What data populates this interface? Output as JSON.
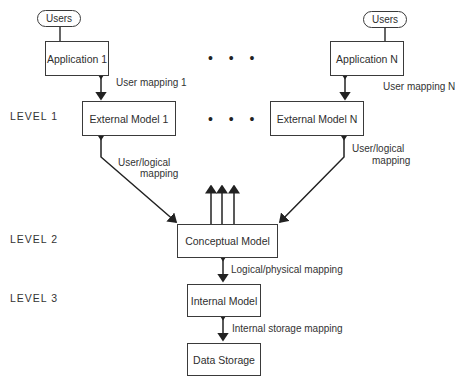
{
  "diagram": {
    "levels": [
      "LEVEL 1",
      "LEVEL 2",
      "LEVEL 3"
    ],
    "users": [
      "Users",
      "Users"
    ],
    "applications": [
      "Application 1",
      "Application N"
    ],
    "external_models": [
      "External Model 1",
      "External Model N"
    ],
    "conceptual_model": "Conceptual Model",
    "internal_model": "Internal Model",
    "data_storage": "Data Storage",
    "ellipsis": "• • •",
    "mappings": {
      "user_mapping_1": "User mapping 1",
      "user_mapping_n": "User mapping N",
      "user_logical_left_1": "User/logical",
      "user_logical_left_2": "mapping",
      "user_logical_right_1": "User/logical",
      "user_logical_right_2": "mapping",
      "logical_physical": "Logical/physical mapping",
      "internal_storage": "Internal storage mapping"
    }
  }
}
